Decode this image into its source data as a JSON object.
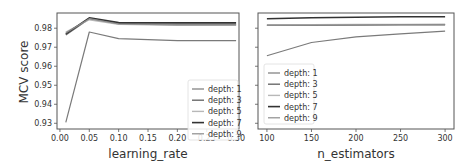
{
  "figure": {
    "ylabel": "MCV score",
    "yticks": [
      "0.93",
      "0.94",
      "0.95",
      "0.96",
      "0.97",
      "0.98"
    ]
  },
  "chart_data": [
    {
      "type": "line",
      "title": "",
      "xlabel": "learning_rate",
      "ylabel": "MCV score",
      "x": [
        0.01,
        0.05,
        0.1,
        0.2,
        0.3
      ],
      "xticks": [
        "0.00",
        "0.05",
        "0.10",
        "0.15",
        "0.20",
        "0.25",
        "0.30"
      ],
      "xlim": [
        -0.005,
        0.305
      ],
      "ylim": [
        0.927,
        0.988
      ],
      "grid": false,
      "legend_position": "lower right",
      "series": [
        {
          "name": "depth: 1",
          "values": [
            0.9305,
            0.978,
            0.9745,
            0.9735,
            0.9735
          ],
          "color": "#7a7a7a",
          "width": 1.2
        },
        {
          "name": "depth: 3",
          "values": [
            0.9765,
            0.985,
            0.9825,
            0.982,
            0.982
          ],
          "color": "#6a6a6a",
          "width": 1.4
        },
        {
          "name": "depth: 5",
          "values": [
            0.978,
            0.9845,
            0.982,
            0.9815,
            0.9815
          ],
          "color": "#b8b8b8",
          "width": 1.4
        },
        {
          "name": "depth: 7",
          "values": [
            0.977,
            0.9855,
            0.983,
            0.9828,
            0.9828
          ],
          "color": "#333333",
          "width": 1.6
        },
        {
          "name": "depth: 9",
          "values": [
            0.9775,
            0.985,
            0.9822,
            0.9818,
            0.9818
          ],
          "color": "#8c8c8c",
          "width": 1.2
        }
      ]
    },
    {
      "type": "line",
      "title": "",
      "xlabel": "n_estimators",
      "ylabel": "",
      "x": [
        100,
        150,
        200,
        250,
        300
      ],
      "xticks": [
        "100",
        "150",
        "200",
        "250",
        "300"
      ],
      "xlim": [
        90,
        310
      ],
      "ylim": [
        0.927,
        0.988
      ],
      "grid": false,
      "legend_position": "lower left",
      "series": [
        {
          "name": "depth: 1",
          "values": [
            0.9655,
            0.9725,
            0.9755,
            0.977,
            0.9785
          ],
          "color": "#7a7a7a",
          "width": 1.2
        },
        {
          "name": "depth: 3",
          "values": [
            0.9815,
            0.9815,
            0.9817,
            0.9818,
            0.9818
          ],
          "color": "#6a6a6a",
          "width": 1.4
        },
        {
          "name": "depth: 5",
          "values": [
            0.9818,
            0.9819,
            0.982,
            0.982,
            0.9821
          ],
          "color": "#b8b8b8",
          "width": 1.4
        },
        {
          "name": "depth: 7",
          "values": [
            0.985,
            0.9855,
            0.9858,
            0.986,
            0.986
          ],
          "color": "#333333",
          "width": 1.6
        },
        {
          "name": "depth: 9",
          "values": [
            0.9816,
            0.9817,
            0.9818,
            0.9819,
            0.9819
          ],
          "color": "#8c8c8c",
          "width": 1.2
        }
      ]
    }
  ]
}
